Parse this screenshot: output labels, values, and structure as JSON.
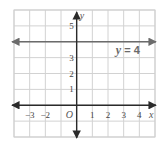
{
  "chart_data": {
    "type": "line",
    "title": "",
    "xlabel": "x",
    "ylabel": "y",
    "origin_label": "O",
    "xlim": [
      -4,
      5
    ],
    "ylim": [
      -2,
      6
    ],
    "grid": true,
    "x_tick_labels": [
      {
        "value": -3,
        "label": "−3"
      },
      {
        "value": -2,
        "label": "−2"
      },
      {
        "value": 1,
        "label": "1"
      },
      {
        "value": 2,
        "label": "2"
      },
      {
        "value": 3,
        "label": "3"
      },
      {
        "value": 4,
        "label": "4"
      }
    ],
    "y_tick_labels": [
      {
        "value": 1,
        "label": "1"
      },
      {
        "value": 2,
        "label": "2"
      },
      {
        "value": 3,
        "label": "3"
      },
      {
        "value": 5,
        "label": "5"
      }
    ],
    "series": [
      {
        "name": "y = 4",
        "kind": "horizontal-line",
        "y": 4,
        "arrows": "both"
      }
    ],
    "annotations": [
      {
        "text_var": "y",
        "text_rest": " = 4",
        "x": 2.5,
        "y": 3.5
      }
    ]
  }
}
